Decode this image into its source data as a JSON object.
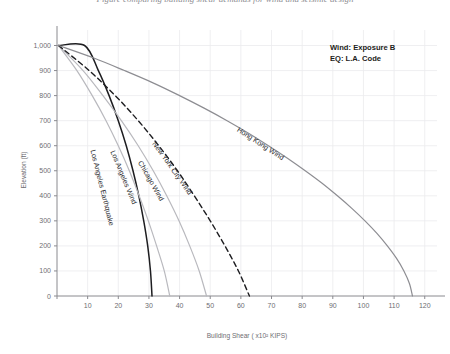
{
  "figure": {
    "header_partial": "Figure comparing building shear demands for wind and seismic design",
    "annotation": {
      "line1": "Wind: Exposure B",
      "line2": "EQ: L.A. Code"
    }
  },
  "chart_data": {
    "type": "line",
    "title": "",
    "xlabel": "Building Shear ( x10² KIPS)",
    "ylabel": "Elevation (ft)",
    "xlim": [
      0,
      124
    ],
    "ylim": [
      0,
      1030
    ],
    "xticks": [
      0,
      10,
      20,
      30,
      40,
      50,
      60,
      70,
      80,
      90,
      100,
      110,
      120
    ],
    "xticklabels": [
      "",
      "10",
      "20",
      "30",
      "40",
      "50",
      "60",
      "70",
      "80",
      "90",
      "100",
      "110",
      "120"
    ],
    "yticks": [
      0,
      100,
      200,
      300,
      400,
      500,
      600,
      700,
      800,
      900,
      1000
    ],
    "yticklabels": [
      "0",
      "100",
      "200",
      "300",
      "400",
      "500",
      "600",
      "700",
      "800",
      "900",
      "1,000"
    ],
    "grid": true,
    "legend": "inline-curve-labels",
    "series": [
      {
        "name": "Los Angeles Earthquake",
        "style": "solid",
        "color": "#1d1d20",
        "width": 1.5,
        "label_anchor": {
          "x": 14,
          "y": 430
        },
        "points": [
          {
            "x": 0.5,
            "y": 1000
          },
          {
            "x": 9.0,
            "y": 1000
          },
          {
            "x": 13.5,
            "y": 900
          },
          {
            "x": 17.0,
            "y": 800
          },
          {
            "x": 20.0,
            "y": 700
          },
          {
            "x": 22.6,
            "y": 600
          },
          {
            "x": 24.8,
            "y": 500
          },
          {
            "x": 26.7,
            "y": 400
          },
          {
            "x": 28.3,
            "y": 300
          },
          {
            "x": 29.6,
            "y": 200
          },
          {
            "x": 30.5,
            "y": 100
          },
          {
            "x": 31.0,
            "y": 0
          }
        ]
      },
      {
        "name": "Los Angeles Wind",
        "style": "solid",
        "color": "#b9b9be",
        "width": 1.2,
        "label_anchor": {
          "x": 21,
          "y": 470
        },
        "points": [
          {
            "x": 0.5,
            "y": 1000
          },
          {
            "x": 6.5,
            "y": 900
          },
          {
            "x": 11.5,
            "y": 800
          },
          {
            "x": 16.0,
            "y": 700
          },
          {
            "x": 20.0,
            "y": 600
          },
          {
            "x": 23.6,
            "y": 500
          },
          {
            "x": 26.8,
            "y": 400
          },
          {
            "x": 29.8,
            "y": 300
          },
          {
            "x": 32.5,
            "y": 200
          },
          {
            "x": 35.0,
            "y": 100
          },
          {
            "x": 36.8,
            "y": 0
          }
        ]
      },
      {
        "name": "Chicago Wind",
        "style": "solid",
        "color": "#b9b9be",
        "width": 1.2,
        "label_anchor": {
          "x": 30,
          "y": 455
        },
        "points": [
          {
            "x": 0.5,
            "y": 1000
          },
          {
            "x": 8.5,
            "y": 900
          },
          {
            "x": 15.0,
            "y": 800
          },
          {
            "x": 21.0,
            "y": 700
          },
          {
            "x": 26.5,
            "y": 600
          },
          {
            "x": 31.4,
            "y": 500
          },
          {
            "x": 35.8,
            "y": 400
          },
          {
            "x": 39.8,
            "y": 300
          },
          {
            "x": 43.3,
            "y": 200
          },
          {
            "x": 46.4,
            "y": 100
          },
          {
            "x": 48.8,
            "y": 0
          }
        ]
      },
      {
        "name": "New York City Wind",
        "style": "dashed",
        "color": "#1d1d20",
        "width": 1.4,
        "label_anchor": {
          "x": 37,
          "y": 505
        },
        "points": [
          {
            "x": 0.5,
            "y": 1000
          },
          {
            "x": 10.5,
            "y": 900
          },
          {
            "x": 19.0,
            "y": 800
          },
          {
            "x": 26.5,
            "y": 700
          },
          {
            "x": 33.2,
            "y": 600
          },
          {
            "x": 39.3,
            "y": 500
          },
          {
            "x": 44.8,
            "y": 400
          },
          {
            "x": 50.0,
            "y": 300
          },
          {
            "x": 54.8,
            "y": 200
          },
          {
            "x": 59.2,
            "y": 100
          },
          {
            "x": 62.8,
            "y": 0
          }
        ]
      },
      {
        "name": "Hong Kong Wind",
        "style": "solid",
        "color": "#8d8d92",
        "width": 1.2,
        "label_anchor": {
          "x": 66,
          "y": 600
        },
        "points": [
          {
            "x": 0.5,
            "y": 1000
          },
          {
            "x": 12.0,
            "y": 950
          },
          {
            "x": 22.0,
            "y": 900
          },
          {
            "x": 31.5,
            "y": 850
          },
          {
            "x": 40.0,
            "y": 800
          },
          {
            "x": 48.0,
            "y": 750
          },
          {
            "x": 55.5,
            "y": 700
          },
          {
            "x": 62.5,
            "y": 650
          },
          {
            "x": 69.0,
            "y": 600
          },
          {
            "x": 75.2,
            "y": 550
          },
          {
            "x": 81.0,
            "y": 500
          },
          {
            "x": 86.5,
            "y": 450
          },
          {
            "x": 91.5,
            "y": 400
          },
          {
            "x": 96.2,
            "y": 350
          },
          {
            "x": 100.5,
            "y": 300
          },
          {
            "x": 104.4,
            "y": 250
          },
          {
            "x": 107.8,
            "y": 200
          },
          {
            "x": 110.8,
            "y": 150
          },
          {
            "x": 113.2,
            "y": 100
          },
          {
            "x": 115.0,
            "y": 50
          },
          {
            "x": 116.0,
            "y": 0
          }
        ]
      }
    ]
  }
}
